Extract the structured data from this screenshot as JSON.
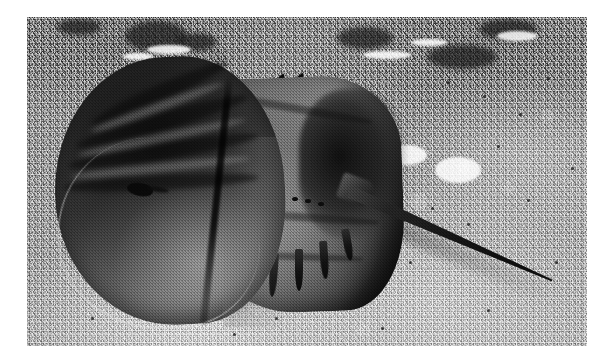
{
  "image": {
    "subject": "horseshoe-crab",
    "species_common_name": "Atlantic horseshoe crab",
    "scene": "horseshoe crab resting on rippled sand seafloor",
    "medium": "black and white photograph",
    "orientation": "landscape",
    "border": "white photographic border",
    "frame": {
      "width": 613,
      "height": 363
    },
    "plate": {
      "left": 27,
      "top": 17,
      "width": 560,
      "height": 329
    }
  },
  "palette": {
    "border": "#ffffff",
    "sand_light": "#c4c4c4",
    "sand_mid": "#9d9d9d",
    "sand_dark": "#6f6f6f",
    "carapace_dark": "#121212",
    "carapace_mid": "#3a3a3a",
    "carapace_light": "#7c7c7c",
    "abdomen_light": "#8e8e8e",
    "telson": "#141414",
    "shadow": "rgba(0,0,0,0.40)"
  },
  "anatomy": {
    "prosoma": {
      "label": "prosoma",
      "description": "large dark horseshoe-shaped head shield on the left"
    },
    "opisthosoma": {
      "label": "opisthosoma",
      "description": "hexagonal abdominal shield with marginal spines"
    },
    "telson": {
      "label": "telson",
      "description": "long tapering tail spike angled down to the right"
    },
    "lateral_eye": {
      "label": "lateral compound eye",
      "description": "dark comma-shaped mark on the carapace"
    },
    "spine_sockets": {
      "label": "movable spine sockets",
      "count": 8
    }
  },
  "ridges": [
    {
      "left": 58,
      "top": 68,
      "width": 150,
      "height": 16,
      "rotate": -24,
      "tone": "dark"
    },
    {
      "left": 46,
      "top": 96,
      "width": 178,
      "height": 17,
      "rotate": -16,
      "tone": "dark"
    },
    {
      "left": 40,
      "top": 126,
      "width": 192,
      "height": 16,
      "rotate": -9,
      "tone": "dark"
    },
    {
      "left": 36,
      "top": 158,
      "width": 196,
      "height": 15,
      "rotate": -3,
      "tone": "dark"
    },
    {
      "left": 60,
      "top": 86,
      "width": 140,
      "height": 9,
      "rotate": -20,
      "tone": "light"
    },
    {
      "left": 50,
      "top": 116,
      "width": 170,
      "height": 9,
      "rotate": -12,
      "tone": "light"
    },
    {
      "left": 44,
      "top": 146,
      "width": 180,
      "height": 9,
      "rotate": -6,
      "tone": "light"
    }
  ],
  "grooves": [
    {
      "left": 196,
      "top": 88,
      "width": 150,
      "height": 8,
      "rotate": 10
    },
    {
      "left": 192,
      "top": 196,
      "width": 160,
      "height": 8,
      "rotate": 4
    },
    {
      "left": 186,
      "top": 236,
      "width": 150,
      "height": 7,
      "rotate": 2
    }
  ],
  "sockets": [
    {
      "left": 200,
      "top": 172
    },
    {
      "left": 213,
      "top": 173
    },
    {
      "left": 226,
      "top": 174
    },
    {
      "left": 239,
      "top": 176
    },
    {
      "left": 252,
      "top": 178
    },
    {
      "left": 265,
      "top": 180
    },
    {
      "left": 278,
      "top": 182
    },
    {
      "left": 291,
      "top": 185
    }
  ],
  "lower_spines": [
    {
      "left": 202,
      "top": 236,
      "width": 7,
      "height": 38,
      "rotate": 8
    },
    {
      "left": 222,
      "top": 238,
      "width": 7,
      "height": 42,
      "rotate": 6
    },
    {
      "left": 244,
      "top": 236,
      "width": 8,
      "height": 44,
      "rotate": 4
    },
    {
      "left": 268,
      "top": 232,
      "width": 8,
      "height": 42,
      "rotate": 0
    },
    {
      "left": 292,
      "top": 224,
      "width": 8,
      "height": 38,
      "rotate": -4
    },
    {
      "left": 314,
      "top": 212,
      "width": 8,
      "height": 32,
      "rotate": -10
    }
  ],
  "upper_spines": [
    {
      "left": 242,
      "top": 54,
      "width": 7,
      "height": 24,
      "rotate": 28
    },
    {
      "left": 258,
      "top": 52,
      "width": 7,
      "height": 26,
      "rotate": 34
    },
    {
      "left": 273,
      "top": 54,
      "width": 7,
      "height": 28,
      "rotate": 40
    },
    {
      "left": 288,
      "top": 60,
      "width": 7,
      "height": 30,
      "rotate": 48
    },
    {
      "left": 302,
      "top": 70,
      "width": 7,
      "height": 30,
      "rotate": 56
    },
    {
      "left": 314,
      "top": 84,
      "width": 7,
      "height": 30,
      "rotate": 64
    },
    {
      "left": 324,
      "top": 100,
      "width": 7,
      "height": 28,
      "rotate": 72
    },
    {
      "left": 332,
      "top": 118,
      "width": 7,
      "height": 26,
      "rotate": 80
    }
  ],
  "sand_pits": [
    {
      "left": 98,
      "top": 4,
      "width": 62,
      "height": 30
    },
    {
      "left": 150,
      "top": 16,
      "width": 40,
      "height": 18
    },
    {
      "left": 310,
      "top": 10,
      "width": 56,
      "height": 22
    },
    {
      "left": 400,
      "top": 28,
      "width": 70,
      "height": 24
    },
    {
      "left": 452,
      "top": 2,
      "width": 58,
      "height": 20
    },
    {
      "left": 30,
      "top": 2,
      "width": 44,
      "height": 16
    }
  ],
  "sand_highlights": [
    {
      "left": 120,
      "top": 28,
      "width": 44,
      "height": 9
    },
    {
      "left": 96,
      "top": 36,
      "width": 30,
      "height": 7
    },
    {
      "left": 336,
      "top": 34,
      "width": 48,
      "height": 8
    },
    {
      "left": 384,
      "top": 22,
      "width": 36,
      "height": 7
    },
    {
      "left": 360,
      "top": 128,
      "width": 40,
      "height": 20
    },
    {
      "left": 408,
      "top": 140,
      "width": 46,
      "height": 26
    },
    {
      "left": 340,
      "top": 160,
      "width": 28,
      "height": 14
    },
    {
      "left": 470,
      "top": 14,
      "width": 40,
      "height": 10
    }
  ],
  "sand_specks": [
    {
      "left": 420,
      "top": 64
    },
    {
      "left": 456,
      "top": 78
    },
    {
      "left": 492,
      "top": 96
    },
    {
      "left": 520,
      "top": 60
    },
    {
      "left": 470,
      "top": 128
    },
    {
      "left": 404,
      "top": 190
    },
    {
      "left": 440,
      "top": 206
    },
    {
      "left": 500,
      "top": 182
    },
    {
      "left": 382,
      "top": 244
    },
    {
      "left": 300,
      "top": 268
    },
    {
      "left": 248,
      "top": 300
    },
    {
      "left": 176,
      "top": 288
    },
    {
      "left": 112,
      "top": 256
    },
    {
      "left": 64,
      "top": 300
    },
    {
      "left": 528,
      "top": 244
    },
    {
      "left": 544,
      "top": 150
    },
    {
      "left": 206,
      "top": 316
    },
    {
      "left": 354,
      "top": 310
    },
    {
      "left": 460,
      "top": 292
    },
    {
      "left": 86,
      "top": 186
    }
  ]
}
